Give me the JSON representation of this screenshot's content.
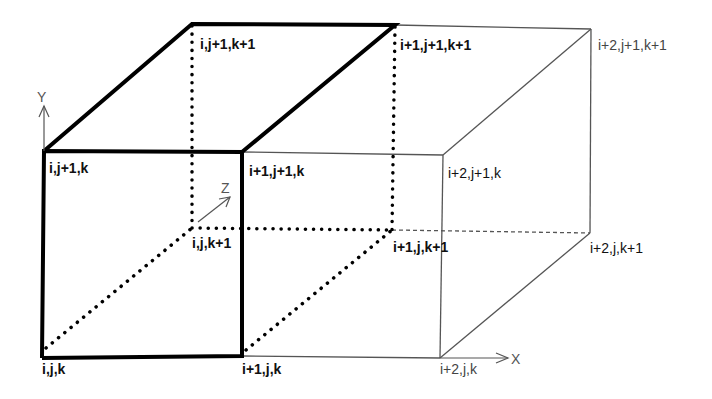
{
  "diagram": {
    "type": "3d-grid-cells",
    "colors": {
      "bold_edge": "#000000",
      "thin_edge": "#555555",
      "text": "#111111",
      "axis": "#555555"
    },
    "axes": {
      "x": {
        "label": "X"
      },
      "y": {
        "label": "Y"
      },
      "z": {
        "label": "Z"
      }
    },
    "vertices": {
      "v_ijk": "i,j,k",
      "v_i1jk": "i+1,j,k",
      "v_i2jk": "i+2,j,k",
      "v_ij1k": "i,j+1,k",
      "v_i1j1k": "i+1,j+1,k",
      "v_i2j1k": "i+2,j+1,k",
      "v_ijk1": "i,j,k+1",
      "v_i1jk1": "i+1,j,k+1",
      "v_i2jk1": "i+2,j,k+1",
      "v_ij1k1": "i,j+1,k+1",
      "v_i1j1k1": "i+1,j+1,k+1",
      "v_i2j1k1": "i+2,j+1,k+1"
    }
  }
}
